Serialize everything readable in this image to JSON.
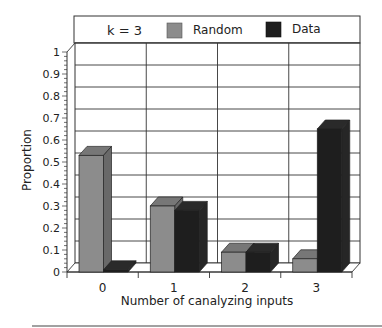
{
  "chart_data": {
    "type": "bar",
    "title": "",
    "legend_title": "k = 3",
    "categories": [
      "0",
      "1",
      "2",
      "3"
    ],
    "series": [
      {
        "name": "Random",
        "color": "#8c8c8c",
        "values": [
          0.53,
          0.3,
          0.09,
          0.06
        ]
      },
      {
        "name": "Data",
        "color": "#1e1e1e",
        "values": [
          0.01,
          0.28,
          0.09,
          0.65
        ]
      }
    ],
    "xlabel": "Number of canalyzing inputs",
    "ylabel": "Proportion",
    "ylim": [
      0,
      1
    ],
    "yticks": [
      "0",
      "0.1",
      "0.2",
      "0.3",
      "0.4",
      "0.5",
      "0.6",
      "0.7",
      "0.8",
      "0.9",
      "1"
    ],
    "grid": true,
    "legend_position": "top",
    "style": "3d"
  }
}
